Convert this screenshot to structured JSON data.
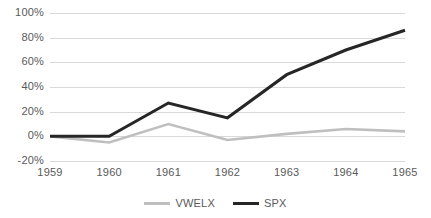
{
  "chart_data": {
    "type": "line",
    "title": "",
    "subtitle": "",
    "xlabel": "",
    "ylabel": "",
    "categories": [
      "1959",
      "1960",
      "1961",
      "1962",
      "1963",
      "1964",
      "1965"
    ],
    "x": [
      1959,
      1960,
      1961,
      1962,
      1963,
      1964,
      1965
    ],
    "series": [
      {
        "name": "VWELX",
        "color": "#bfbfbf",
        "values": [
          0,
          -5,
          10,
          -3,
          2,
          6,
          4
        ]
      },
      {
        "name": "SPX",
        "color": "#262626",
        "values": [
          0,
          0,
          27,
          15,
          50,
          70,
          86
        ]
      }
    ],
    "ylim": [
      -20,
      100
    ],
    "y_ticks": [
      100,
      80,
      60,
      40,
      20,
      0,
      -20
    ],
    "y_tick_labels": [
      "100%",
      "80%",
      "60%",
      "40%",
      "20%",
      "0%",
      "-20%"
    ],
    "grid": true,
    "grid_color": "#d9d9d9",
    "legend_position": "bottom",
    "value_format": "percent"
  },
  "axes": {
    "y": {
      "labels": [
        "100%",
        "80%",
        "60%",
        "40%",
        "20%",
        "0%",
        "-20%"
      ]
    },
    "x": {
      "labels": [
        "1959",
        "1960",
        "1961",
        "1962",
        "1963",
        "1964",
        "1965"
      ]
    }
  },
  "legend": {
    "entries": [
      {
        "label": "VWELX",
        "color": "#bfbfbf"
      },
      {
        "label": "SPX",
        "color": "#262626"
      }
    ]
  }
}
